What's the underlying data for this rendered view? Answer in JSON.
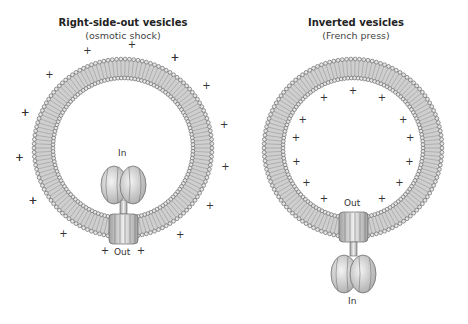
{
  "panels": [
    {
      "title": "Right-side-out vesicles",
      "subtitle": "(osmotic shock)",
      "top_label": "In",
      "bottom_label": "Out",
      "charge_side": "outside",
      "charge_symbol": "+"
    },
    {
      "title": "Inverted vesicles",
      "subtitle": "(French press)",
      "top_label": "Out",
      "bottom_label": "In",
      "charge_side": "inside",
      "charge_symbol": "+"
    }
  ],
  "colors": {
    "membrane": "#bdbdbd",
    "head": "#555555",
    "protein": "#d6d6d6",
    "stroke": "#555555"
  }
}
